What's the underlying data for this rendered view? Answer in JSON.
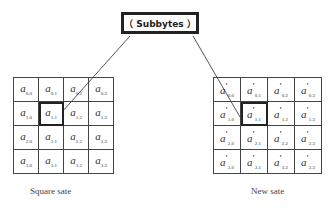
{
  "process_box": {
    "label": "（ Subbytes ）"
  },
  "left_state": {
    "caption": "Square sate",
    "symbol": "a",
    "highlighted": "1.1",
    "rows": [
      [
        "0.0",
        "0.1",
        "0.2",
        "0.3"
      ],
      [
        "1.0",
        "1.1",
        "1.2",
        "1.3"
      ],
      [
        "2.0",
        "2.1",
        "2.2",
        "2.3"
      ],
      [
        "3.0",
        "3.1",
        "3.2",
        "3.3"
      ]
    ]
  },
  "right_state": {
    "caption": "New sate",
    "symbol": "a",
    "prime": "'",
    "highlighted": "1.1",
    "rows": [
      [
        "0.0",
        "0.1",
        "0.2",
        "0.3"
      ],
      [
        "1.0",
        "1.1",
        "1.2",
        "1.3"
      ],
      [
        "2.0",
        "2.1",
        "2.2",
        "2.3"
      ],
      [
        "3.0",
        "3.1",
        "3.2",
        "3.3"
      ]
    ]
  },
  "arrows": [
    {
      "from": "left_state.1.1",
      "to": "process_box"
    },
    {
      "from": "process_box",
      "to": "right_state.1.1"
    }
  ]
}
